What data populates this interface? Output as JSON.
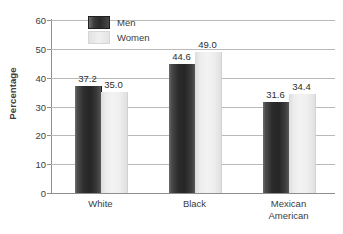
{
  "chart_data": {
    "type": "bar",
    "title": "",
    "xlabel": "",
    "ylabel": "Percentage",
    "ylim": [
      0,
      60
    ],
    "yticks": [
      0,
      10,
      20,
      30,
      40,
      50,
      60
    ],
    "grid": true,
    "legend_position": "top-left-inside",
    "categories": [
      "White",
      "Black",
      "Mexican American"
    ],
    "category_lines": [
      [
        "White"
      ],
      [
        "Black"
      ],
      [
        "Mexican",
        "American"
      ]
    ],
    "series": [
      {
        "name": "Men",
        "color": "#2c2c2c",
        "values": [
          37.2,
          44.6,
          31.6
        ],
        "labels": [
          "37.2",
          "44.6",
          "31.6"
        ]
      },
      {
        "name": "Women",
        "color": "#ededed",
        "values": [
          35.0,
          49.0,
          34.4
        ],
        "labels": [
          "35.0",
          "49.0",
          "34.4"
        ]
      }
    ]
  },
  "axis": {
    "y_tick_labels": [
      "0",
      "10",
      "20",
      "30",
      "40",
      "50",
      "60"
    ],
    "y_title": "Percentage"
  },
  "legend": {
    "items": [
      {
        "label": "Men"
      },
      {
        "label": "Women"
      }
    ]
  }
}
